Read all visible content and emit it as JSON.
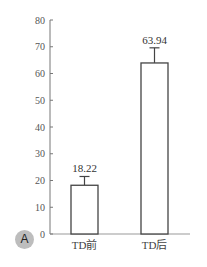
{
  "chart_data": {
    "type": "bar",
    "title": "",
    "xlabel": "",
    "ylabel": "",
    "categories": [
      "TD前",
      "TD后"
    ],
    "values": [
      18.22,
      63.94
    ],
    "error_upper": [
      21.5,
      69.6
    ],
    "data_labels": [
      "18.22",
      "63.94"
    ],
    "ylim": [
      0,
      80
    ],
    "yticks": [
      0,
      10,
      20,
      30,
      40,
      50,
      60,
      70,
      80
    ],
    "grid": false,
    "legend": null,
    "bar_fill": "#ffffff",
    "bar_stroke": "#444444"
  },
  "panel": {
    "label": "A"
  }
}
